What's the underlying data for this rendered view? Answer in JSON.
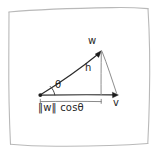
{
  "diagram": {
    "kind": "vector-projection-sketch",
    "style": "hand-drawn",
    "canvas": {
      "width": 159,
      "height": 158
    },
    "colors": {
      "background": "#ffffff",
      "frame": "#b9b9b9",
      "vector_line": "#2b2b2b",
      "helper_line": "#8d8d8d",
      "bracket": "#7d7d7d",
      "text": "#262626"
    },
    "labels": {
      "vector_w": "w",
      "vector_v": "v",
      "height": "h",
      "angle": "θ",
      "projection": "‖w‖ cosθ"
    },
    "geometry": {
      "origin": {
        "x": 40,
        "y": 95
      },
      "w_tip": {
        "x": 101,
        "y": 50
      },
      "v_tip": {
        "x": 118,
        "y": 95
      },
      "foot_of_height": {
        "x": 101,
        "y": 95
      },
      "bracket_span": {
        "x1": 40,
        "x2": 101,
        "y": 103
      },
      "angle_arc_radius": 14
    }
  }
}
